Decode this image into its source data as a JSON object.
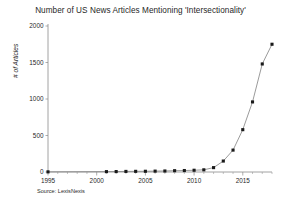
{
  "chart_data": {
    "type": "line",
    "title": "Number of US News Articles Mentioning 'Intersectionality'",
    "subtitle": "",
    "xlabel": "",
    "ylabel": "# of Articles",
    "source_note": "Source: LexisNexis",
    "grid": false,
    "legend": "none",
    "marker": "square",
    "line_color": "#7a7a7a",
    "marker_color": "#1a1a1a",
    "background_color": "#ffffff",
    "axis_color": "#8a8a8a",
    "xlim": [
      1995,
      2018
    ],
    "ylim": [
      0,
      2000
    ],
    "xticks": [
      1995,
      2000,
      2005,
      2010,
      2015
    ],
    "xtick_labels": [
      "1995",
      "2000",
      "2005",
      "2010",
      "2015"
    ],
    "xminor_ticks": [
      1996,
      1997,
      1998,
      1999,
      2001,
      2002,
      2003,
      2004,
      2006,
      2007,
      2008,
      2009,
      2011,
      2012,
      2013,
      2014,
      2016,
      2017,
      2018
    ],
    "yticks": [
      0,
      500,
      1000,
      1500,
      2000
    ],
    "ytick_labels": [
      "0",
      "500",
      "1000",
      "1500",
      "2000"
    ],
    "x": [
      1995,
      2001,
      2002,
      2003,
      2004,
      2005,
      2006,
      2007,
      2008,
      2009,
      2010,
      2011,
      2012,
      2013,
      2014,
      2015,
      2016,
      2017,
      2018
    ],
    "values": [
      2,
      5,
      6,
      8,
      9,
      10,
      12,
      14,
      18,
      20,
      24,
      30,
      60,
      150,
      300,
      580,
      960,
      1480,
      1750
    ],
    "series": [
      {
        "name": "# of Articles",
        "x": [
          1995,
          2001,
          2002,
          2003,
          2004,
          2005,
          2006,
          2007,
          2008,
          2009,
          2010,
          2011,
          2012,
          2013,
          2014,
          2015,
          2016,
          2017,
          2018
        ],
        "values": [
          2,
          5,
          6,
          8,
          9,
          10,
          12,
          14,
          18,
          20,
          24,
          30,
          60,
          150,
          300,
          580,
          960,
          1480,
          1750
        ]
      }
    ]
  }
}
